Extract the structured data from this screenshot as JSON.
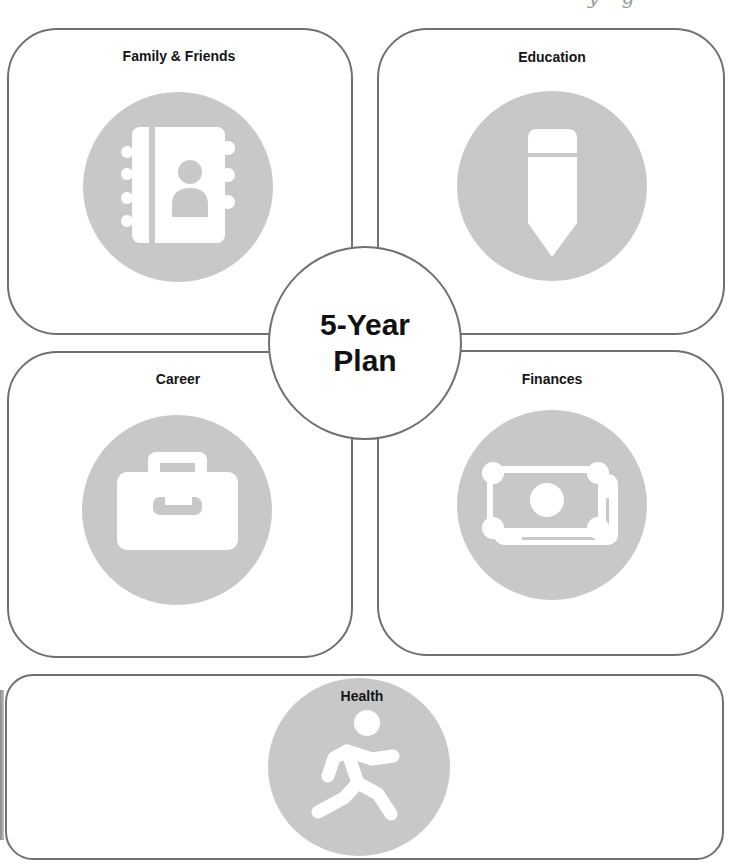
{
  "page": {
    "clipped_header_text": "y g"
  },
  "center": {
    "title_line1": "5-Year",
    "title_line2": "Plan"
  },
  "panels": [
    {
      "id": "family-friends",
      "label": "Family & Friends",
      "icon": "address-book-icon"
    },
    {
      "id": "education",
      "label": "Education",
      "icon": "pencil-icon"
    },
    {
      "id": "career",
      "label": "Career",
      "icon": "briefcase-icon"
    },
    {
      "id": "finances",
      "label": "Finances",
      "icon": "money-bill-icon"
    },
    {
      "id": "health",
      "label": "Health",
      "icon": "walking-person-icon"
    }
  ],
  "colors": {
    "border": "#707070",
    "icon_circle": "#c8c8c8",
    "icon_glyph": "#ffffff",
    "text": "#111111",
    "background": "#ffffff"
  }
}
